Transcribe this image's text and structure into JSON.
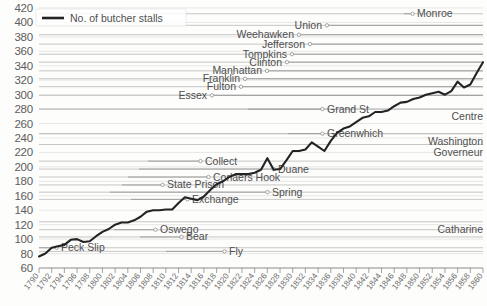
{
  "legend": {
    "label": "No. of butcher stalls",
    "position": "top-left"
  },
  "axes": {
    "y": {
      "ticks": [
        60,
        80,
        100,
        120,
        140,
        160,
        180,
        200,
        220,
        240,
        260,
        280,
        300,
        320,
        340,
        360,
        380,
        400,
        420
      ],
      "min": 60,
      "max": 420,
      "step": 20,
      "label": ""
    },
    "x": {
      "min": 1790,
      "max": 1860,
      "step": 2,
      "ticks": [
        "1790",
        "1792",
        "1794",
        "1796",
        "1798",
        "1800",
        "1802",
        "1804",
        "1806",
        "1808",
        "1810",
        "1812",
        "1814",
        "1816",
        "1818",
        "1820",
        "1822",
        "1824",
        "1826",
        "1828",
        "1830",
        "1832",
        "1834",
        "1836",
        "1838",
        "1840",
        "1842",
        "1844",
        "1846",
        "1848",
        "1850",
        "1852",
        "1854",
        "1856",
        "1858",
        "1860"
      ],
      "label": ""
    }
  },
  "annotations": [
    {
      "name": "Monroe",
      "value": 412,
      "align": "left",
      "text_x": 417,
      "line_x1": 404,
      "line_x2": 414
    },
    {
      "name": "Union",
      "value": 396,
      "align": "right",
      "text_x": 322,
      "line_x1": 325,
      "line_x2": 483
    },
    {
      "name": "Weehawken",
      "value": 383,
      "align": "right",
      "text_x": 294,
      "line_x1": 297,
      "line_x2": 483
    },
    {
      "name": "Jefferson",
      "value": 370,
      "align": "right",
      "text_x": 305,
      "line_x1": 308,
      "line_x2": 483
    },
    {
      "name": "Tompkins",
      "value": 356,
      "align": "right",
      "text_x": 287,
      "line_x1": 290,
      "line_x2": 483
    },
    {
      "name": "Clinton",
      "value": 345,
      "align": "right",
      "text_x": 282,
      "line_x1": 285,
      "line_x2": 483
    },
    {
      "name": "Manhattan",
      "value": 333,
      "align": "right",
      "text_x": 262,
      "line_x1": 265,
      "line_x2": 483
    },
    {
      "name": "Franklin",
      "value": 322,
      "align": "right",
      "text_x": 240,
      "line_x1": 243,
      "line_x2": 483
    },
    {
      "name": "Fulton",
      "value": 311,
      "align": "right",
      "text_x": 236,
      "line_x1": 239,
      "line_x2": 483
    },
    {
      "name": "Essex",
      "value": 299,
      "align": "right",
      "text_x": 207,
      "line_x1": 210,
      "line_x2": 483
    },
    {
      "name": "Grand St",
      "value": 280,
      "align": "left",
      "text_x": 327,
      "line_x1": 248,
      "line_x2": 324
    },
    {
      "name": "Centre",
      "value": 280,
      "align": "right-edge",
      "text_x": 483,
      "line_x1": 0,
      "line_x2": 0
    },
    {
      "name": "Greenwhich",
      "value": 246,
      "align": "left",
      "text_x": 327,
      "line_x1": 288,
      "line_x2": 324
    },
    {
      "name": "Washington",
      "value": 246,
      "align": "right-edge",
      "text_x": 483,
      "line_x1": 0,
      "line_x2": 0
    },
    {
      "name": "Governeur",
      "value": 231,
      "align": "right-edge",
      "text_x": 483,
      "line_x1": 0,
      "line_x2": 0
    },
    {
      "name": "Collect",
      "value": 208,
      "align": "left",
      "text_x": 205,
      "line_x1": 148,
      "line_x2": 202
    },
    {
      "name": "Duane",
      "value": 197,
      "align": "left",
      "text_x": 278,
      "line_x1": 139,
      "line_x2": 275
    },
    {
      "name": "Corlaers Hook",
      "value": 186,
      "align": "left",
      "text_x": 213,
      "line_x1": 128,
      "line_x2": 210
    },
    {
      "name": "State Prison",
      "value": 175,
      "align": "left",
      "text_x": 167,
      "line_x1": 122,
      "line_x2": 164
    },
    {
      "name": "Spring",
      "value": 165,
      "align": "left",
      "text_x": 272,
      "line_x1": 110,
      "line_x2": 269
    },
    {
      "name": "Exchange",
      "value": 155,
      "align": "left",
      "text_x": 192,
      "line_x1": 131,
      "line_x2": 189
    },
    {
      "name": "Catharine",
      "value": 124,
      "align": "right-edge",
      "text_x": 483,
      "line_x1": 0,
      "line_x2": 0
    },
    {
      "name": "Oswego",
      "value": 113,
      "align": "left",
      "text_x": 160,
      "line_x1": 114,
      "line_x2": 157
    },
    {
      "name": "Bear",
      "value": 103,
      "align": "left",
      "text_x": 186,
      "line_x1": 140,
      "line_x2": 183
    },
    {
      "name": "Fly",
      "value": 83,
      "align": "left",
      "text_x": 229,
      "line_x1": 166,
      "line_x2": 226
    },
    {
      "name": "Peck Slip",
      "value": 88,
      "align": "left",
      "text_x": 61,
      "line_x1": 39,
      "line_x2": 58
    }
  ],
  "chart_data": {
    "type": "line",
    "title": "",
    "xlabel": "",
    "ylabel": "",
    "xlim": [
      1790,
      1860
    ],
    "ylim": [
      60,
      420
    ],
    "grid": true,
    "legend_position": "top-left",
    "series": [
      {
        "name": "No. of butcher stalls",
        "color": "#232323",
        "x": [
          1790,
          1791,
          1792,
          1793,
          1794,
          1795,
          1796,
          1797,
          1798,
          1799,
          1800,
          1801,
          1802,
          1803,
          1804,
          1805,
          1806,
          1807,
          1808,
          1809,
          1810,
          1811,
          1812,
          1813,
          1814,
          1815,
          1816,
          1817,
          1818,
          1819,
          1820,
          1821,
          1822,
          1823,
          1824,
          1825,
          1826,
          1827,
          1828,
          1829,
          1830,
          1831,
          1832,
          1833,
          1834,
          1835,
          1836,
          1837,
          1838,
          1839,
          1840,
          1841,
          1842,
          1843,
          1844,
          1845,
          1846,
          1847,
          1848,
          1849,
          1850,
          1851,
          1852,
          1853,
          1854,
          1855,
          1856,
          1857,
          1858,
          1859,
          1860
        ],
        "values": [
          76,
          80,
          88,
          90,
          92,
          99,
          100,
          96,
          97,
          104,
          110,
          114,
          120,
          123,
          123,
          126,
          131,
          138,
          140,
          140,
          141,
          141,
          150,
          158,
          156,
          154,
          159,
          168,
          176,
          180,
          186,
          190,
          190,
          190,
          192,
          196,
          212,
          196,
          197,
          209,
          222,
          222,
          224,
          234,
          228,
          222,
          236,
          247,
          253,
          256,
          262,
          268,
          270,
          276,
          276,
          278,
          284,
          289,
          290,
          294,
          296,
          300,
          302,
          304,
          300,
          305,
          318,
          310,
          314,
          330,
          345
        ]
      }
    ]
  },
  "line_path": {
    "points": "39,264 43,258 47,251 51,249 54,246 58,236 62,235 66,240 70,239 73,231 77,223 81,217 85,208 89,204 92,204 96,200 100,193 104,182 108,178 111,178 115,176 119,176 123,163 127,152 131,154 134,158 138,151 142,138 146,127 150,122 154,114 157,108 161,108 165,108 169,105 173,100 177,77 181,100 184,98 188,80 192,61 196,61 200,58 204,43 208,51 211,61 215,41 219,25 223,17 227,13 231,9 235,4 239,3 243,1 246,2 250,5 254,9 258,13 262,17 266,21 270,20 273,24 277,28 281,22 285,30 289,34 293,28 297,24 301,12"
  }
}
